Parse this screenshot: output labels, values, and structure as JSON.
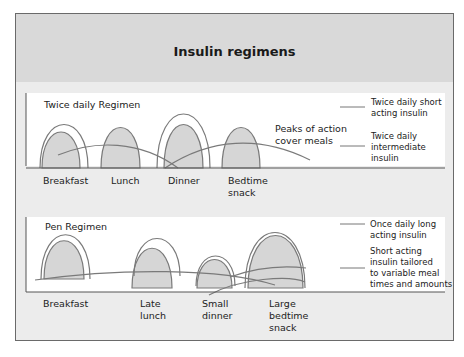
{
  "title": "Insulin regimens",
  "panels": [
    {
      "name": "Twice daily Regimen",
      "meals": [
        "Breakfast",
        "Lunch",
        "Dinner",
        "Bedtime snack"
      ],
      "meal_lines": [
        [
          "Breakfast"
        ],
        [
          "Lunch"
        ],
        [
          "Dinner"
        ],
        [
          "Bedtime",
          "snack"
        ]
      ],
      "annotation": [
        "Peaks of action",
        "cover meals"
      ],
      "legend": [
        {
          "label_lines": [
            "Twice daily short",
            "acting insulin"
          ]
        },
        {
          "label_lines": [
            "Twice daily",
            "intermediate",
            "insulin"
          ]
        }
      ]
    },
    {
      "name": "Pen Regimen",
      "meal_lines": [
        [
          "Breakfast"
        ],
        [
          "Late",
          "lunch"
        ],
        [
          "Small",
          "dinner"
        ],
        [
          "Large",
          "bedtime",
          "snack"
        ]
      ],
      "legend": [
        {
          "label_lines": [
            "Once daily long",
            "acting insulin"
          ]
        },
        {
          "label_lines": [
            "Short acting",
            "insulin tailored",
            "to variable meal",
            "times and amounts"
          ]
        }
      ]
    }
  ],
  "colors": {
    "header_bg": "#d9d9d9",
    "frame_bg": "#ececec",
    "curve_fill": "#d6d6d6",
    "curve_stroke": "#7a7a7a"
  }
}
